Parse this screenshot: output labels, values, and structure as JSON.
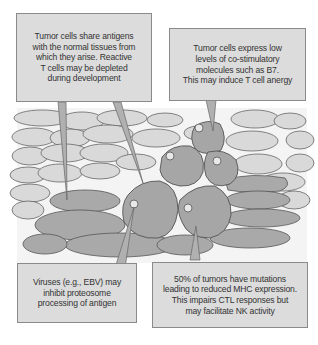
{
  "diagram": {
    "type": "tumor-immune-evasion-illustration",
    "colors": {
      "normal_cell_fill": "#d8d8d8",
      "tumor_cell_fill": "#a8a8a8",
      "cell_outline": "#555555",
      "nucleus_fill": "#e6e6e6",
      "callout_fill": "#dcdcdc",
      "callout_border": "#8a8a8a",
      "background_band": "#f2f2f2"
    },
    "callouts": [
      {
        "id": "shared-antigens",
        "text": "Tumor cells share antigens\nwith the normal tissues from\nwhich they arise. Reactive\nT cells may be depleted\nduring development"
      },
      {
        "id": "low-costimulatory",
        "text": "Tumor cells express low\nlevels of co-stimulatory\nmolecules such as B7.\nThis may induce T cell anergy"
      },
      {
        "id": "viruses-proteosome",
        "text": "Viruses (e.g., EBV) may\ninhibit proteosome\nprocessing of antigen"
      },
      {
        "id": "reduced-mhc",
        "text": "50% of tumors have mutations\nleading to reduced MHC expression.\nThis impairs CTL responses but\nmay facilitate NK activity"
      }
    ]
  }
}
